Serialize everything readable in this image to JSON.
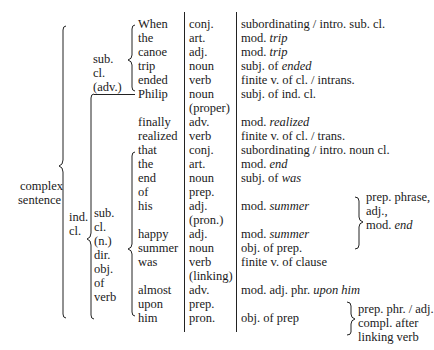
{
  "top_cut_text": "",
  "labels": {
    "complex": "complex",
    "sentence": "sentence",
    "ind": "ind.",
    "cl": "cl.",
    "sub_adv": [
      "sub.",
      "cl.",
      "(adv.)"
    ],
    "sub_n": [
      "sub.",
      "cl.",
      "(n.)",
      "dir.",
      "obj.",
      "of",
      "verb"
    ]
  },
  "rows": [
    {
      "word": "When",
      "pos": "conj.",
      "func": "subordinating / intro. sub. cl."
    },
    {
      "word": "the",
      "pos": "art.",
      "func": "mod. ",
      "func_it": "trip"
    },
    {
      "word": "canoe",
      "pos": "adj.",
      "func": "mod. ",
      "func_it": "trip"
    },
    {
      "word": "trip",
      "pos": "noun",
      "func": "subj. of ",
      "func_it": "ended"
    },
    {
      "word": "ended",
      "pos": "verb",
      "func": "finite v. of cl. / intrans."
    },
    {
      "word": "Philip",
      "pos": "noun",
      "func": "subj. of ind. cl."
    },
    {
      "word": "",
      "pos": "(proper)",
      "func": ""
    },
    {
      "word": "finally",
      "pos": "adv.",
      "func": "mod. ",
      "func_it": "realized"
    },
    {
      "word": "realized",
      "pos": "verb",
      "func": "finite v. of cl. / trans."
    },
    {
      "word": "that",
      "pos": "conj.",
      "func": "subordinating / intro. noun cl."
    },
    {
      "word": "the",
      "pos": "art.",
      "func": "mod. ",
      "func_it": "end"
    },
    {
      "word": "end",
      "pos": "noun",
      "func": "subj. of ",
      "func_it": "was"
    },
    {
      "word": "of",
      "pos": "prep.",
      "func": ""
    },
    {
      "word": "his",
      "pos": "adj.",
      "func": "mod. ",
      "func_it": "summer"
    },
    {
      "word": "",
      "pos": "(pron.)",
      "func": ""
    },
    {
      "word": "happy",
      "pos": "adj.",
      "func": "mod. ",
      "func_it": "summer"
    },
    {
      "word": "summer",
      "pos": "noun",
      "func": "obj. of prep."
    },
    {
      "word": "was",
      "pos": "verb",
      "func": "finite v. of clause"
    },
    {
      "word": "",
      "pos": "(linking)",
      "func": ""
    },
    {
      "word": "almost",
      "pos": "adv.",
      "func": "mod. adj. phr. ",
      "func_it": "upon him"
    },
    {
      "word": "upon",
      "pos": "prep.",
      "func": ""
    },
    {
      "word": "him",
      "pos": "pron.",
      "func": "obj. of prep"
    }
  ],
  "brace_notes": {
    "prep_phrase": [
      "prep. phrase,",
      "adj.,",
      "mod. "
    ],
    "prep_phrase_it": "end",
    "prep_phr_adj": [
      "prep. phr. / adj.",
      "compl. after",
      "linking verb"
    ]
  }
}
